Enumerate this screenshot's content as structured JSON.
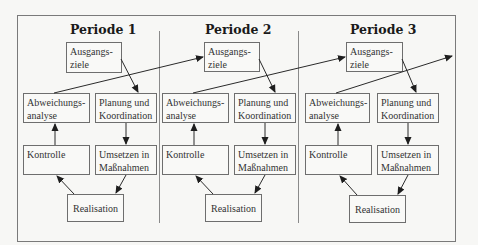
{
  "diagram": {
    "periods": [
      {
        "title": "Periode 1",
        "boxes": {
          "ausgangsziele": "Ausgangs-\nziele",
          "abweichungsanalyse": "Abweichungs-\nanalyse",
          "planung": "Planung und\nKoordination",
          "kontrolle": "Kontrolle",
          "umsetzen": "Umsetzen in\nMaßnahmen",
          "realisation": "Realisation"
        }
      },
      {
        "title": "Periode 2",
        "boxes": {
          "ausgangsziele": "Ausgangs-\nziele",
          "abweichungsanalyse": "Abweichungs-\nanalyse",
          "planung": "Planung und\nKoordination",
          "kontrolle": "Kontrolle",
          "umsetzen": "Umsetzen in\nMaßnahmen",
          "realisation": "Realisation"
        }
      },
      {
        "title": "Periode 3",
        "boxes": {
          "ausgangsziele": "Ausgangs-\nziele",
          "abweichungsanalyse": "Abweichungs-\nanalyse",
          "planung": "Planung und\nKoordination",
          "kontrolle": "Kontrolle",
          "umsetzen": "Umsetzen in\nMaßnahmen",
          "realisation": "Realisation"
        }
      }
    ],
    "edges": [
      {
        "from": "Ausgangsziele",
        "to": "Planung und Koordination"
      },
      {
        "from": "Planung und Koordination",
        "to": "Umsetzen in Maßnahmen"
      },
      {
        "from": "Umsetzen in Maßnahmen",
        "to": "Realisation"
      },
      {
        "from": "Realisation",
        "to": "Kontrolle"
      },
      {
        "from": "Kontrolle",
        "to": "Abweichungsanalyse"
      },
      {
        "from": "Abweichungsanalyse (Periode n)",
        "to": "Ausgangsziele (Periode n+1)"
      }
    ],
    "colors": {
      "background": "#f7f7f5",
      "line": "#2a2a2a",
      "border": "#6e6e6e"
    }
  }
}
